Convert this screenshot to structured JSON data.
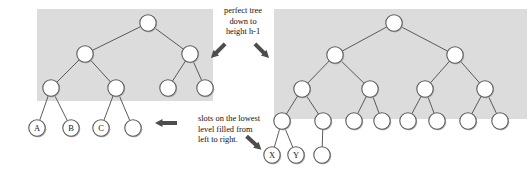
{
  "figure": {
    "background_color": "#ffffff",
    "shade_color": "#dcdcdc",
    "node_fill": "#ffffff",
    "node_stroke": "#5a5a5a",
    "edge_color": "#4a4a4a",
    "arrow_color": "#4d4d4d"
  },
  "annotations": {
    "top_note": "perfect tree\ndown to\nheight h-1",
    "bottom_note": "slots on the lowest\nlevel filled from\nleft to right.",
    "top_note_lines": [
      "perfect tree",
      "down to",
      "height h-1"
    ],
    "bottom_note_lines": [
      "slots on the lowest",
      "level filled from",
      "left to right."
    ]
  },
  "arrows": [
    {
      "name": "arrow-down-left",
      "direction": "down-left"
    },
    {
      "name": "arrow-down-right-top",
      "direction": "down-right"
    },
    {
      "name": "arrow-left",
      "direction": "left"
    },
    {
      "name": "arrow-down-right-bottom",
      "direction": "down-right"
    }
  ],
  "left_tree": {
    "name": "left-binary-tree",
    "shaded_region": {
      "x": 37,
      "y": 9,
      "width": 176,
      "height": 92
    },
    "node_radius": 8.2,
    "levels": 4,
    "nodes": [
      {
        "id": "L0-0",
        "x": 148,
        "y": 23,
        "label": "",
        "level": 0,
        "shaded": true
      },
      {
        "id": "L1-0",
        "x": 85,
        "y": 54,
        "label": "",
        "level": 1,
        "shaded": true
      },
      {
        "id": "L1-1",
        "x": 190,
        "y": 54,
        "label": "",
        "level": 1,
        "shaded": true
      },
      {
        "id": "L2-0",
        "x": 51,
        "y": 88,
        "label": "",
        "level": 2,
        "shaded": true
      },
      {
        "id": "L2-1",
        "x": 116,
        "y": 88,
        "label": "",
        "level": 2,
        "shaded": true
      },
      {
        "id": "L2-2",
        "x": 168,
        "y": 88,
        "label": "",
        "level": 2,
        "shaded": true
      },
      {
        "id": "L2-3",
        "x": 205,
        "y": 88,
        "label": "",
        "level": 2,
        "shaded": true
      },
      {
        "id": "L3-0",
        "x": 37,
        "y": 128,
        "label": "A",
        "level": 3,
        "shaded": false
      },
      {
        "id": "L3-1",
        "x": 71,
        "y": 128,
        "label": "B",
        "level": 3,
        "shaded": false
      },
      {
        "id": "L3-2",
        "x": 101,
        "y": 128,
        "label": "C",
        "level": 3,
        "shaded": false
      },
      {
        "id": "L3-3",
        "x": 133,
        "y": 128,
        "label": "",
        "level": 3,
        "shaded": false
      }
    ],
    "edges": [
      [
        "L0-0",
        "L1-0"
      ],
      [
        "L0-0",
        "L1-1"
      ],
      [
        "L1-0",
        "L2-0"
      ],
      [
        "L1-0",
        "L2-1"
      ],
      [
        "L1-1",
        "L2-2"
      ],
      [
        "L1-1",
        "L2-3"
      ],
      [
        "L2-0",
        "L3-0"
      ],
      [
        "L2-0",
        "L3-1"
      ],
      [
        "L2-1",
        "L3-2"
      ],
      [
        "L2-1",
        "L3-3"
      ]
    ],
    "labels_present": [
      "A",
      "B",
      "C"
    ]
  },
  "right_tree": {
    "name": "right-binary-tree",
    "shaded_region": {
      "x": 274,
      "y": 9,
      "width": 253,
      "height": 110
    },
    "node_radius": 8.2,
    "levels": 5,
    "nodes": [
      {
        "id": "R0-0",
        "x": 394,
        "y": 23,
        "label": "",
        "level": 0,
        "shaded": true
      },
      {
        "id": "R1-0",
        "x": 335,
        "y": 55,
        "label": "",
        "level": 1,
        "shaded": true
      },
      {
        "id": "R1-1",
        "x": 455,
        "y": 55,
        "label": "",
        "level": 1,
        "shaded": true
      },
      {
        "id": "R2-0",
        "x": 302,
        "y": 89,
        "label": "",
        "level": 2,
        "shaded": true
      },
      {
        "id": "R2-1",
        "x": 370,
        "y": 89,
        "label": "",
        "level": 2,
        "shaded": true
      },
      {
        "id": "R2-2",
        "x": 425,
        "y": 89,
        "label": "",
        "level": 2,
        "shaded": true
      },
      {
        "id": "R2-3",
        "x": 485,
        "y": 89,
        "label": "",
        "level": 2,
        "shaded": true
      },
      {
        "id": "R3-0",
        "x": 282,
        "y": 121,
        "label": "",
        "level": 3,
        "shaded": true
      },
      {
        "id": "R3-1",
        "x": 323,
        "y": 121,
        "label": "",
        "level": 3,
        "shaded": true
      },
      {
        "id": "R3-2",
        "x": 354,
        "y": 121,
        "label": "",
        "level": 3,
        "shaded": true
      },
      {
        "id": "R3-3",
        "x": 382,
        "y": 121,
        "label": "",
        "level": 3,
        "shaded": true
      },
      {
        "id": "R3-4",
        "x": 408,
        "y": 121,
        "label": "",
        "level": 3,
        "shaded": true
      },
      {
        "id": "R3-5",
        "x": 437,
        "y": 121,
        "label": "",
        "level": 3,
        "shaded": true
      },
      {
        "id": "R3-6",
        "x": 468,
        "y": 121,
        "label": "",
        "level": 3,
        "shaded": true
      },
      {
        "id": "R3-7",
        "x": 500,
        "y": 121,
        "label": "",
        "level": 3,
        "shaded": true
      },
      {
        "id": "R4-0",
        "x": 272,
        "y": 155,
        "label": "X",
        "level": 4,
        "shaded": false
      },
      {
        "id": "R4-1",
        "x": 296,
        "y": 155,
        "label": "Y",
        "level": 4,
        "shaded": false
      },
      {
        "id": "R4-2",
        "x": 322,
        "y": 155,
        "label": "",
        "level": 4,
        "shaded": false
      }
    ],
    "edges": [
      [
        "R0-0",
        "R1-0"
      ],
      [
        "R0-0",
        "R1-1"
      ],
      [
        "R1-0",
        "R2-0"
      ],
      [
        "R1-0",
        "R2-1"
      ],
      [
        "R1-1",
        "R2-2"
      ],
      [
        "R1-1",
        "R2-3"
      ],
      [
        "R2-0",
        "R3-0"
      ],
      [
        "R2-0",
        "R3-1"
      ],
      [
        "R2-1",
        "R3-2"
      ],
      [
        "R2-1",
        "R3-3"
      ],
      [
        "R2-2",
        "R3-4"
      ],
      [
        "R2-2",
        "R3-5"
      ],
      [
        "R2-3",
        "R3-6"
      ],
      [
        "R2-3",
        "R3-7"
      ],
      [
        "R3-0",
        "R4-0"
      ],
      [
        "R3-0",
        "R4-1"
      ],
      [
        "R3-1",
        "R4-2"
      ]
    ],
    "labels_present": [
      "X",
      "Y"
    ]
  }
}
